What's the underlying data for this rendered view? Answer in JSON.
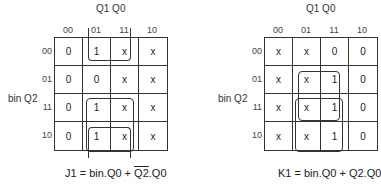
{
  "kmaps": [
    {
      "id": "J1",
      "col_title": "Q1 Q0",
      "row_title": "bin Q2",
      "col_labels": [
        "00",
        "01",
        "11",
        "10"
      ],
      "row_labels": [
        "00",
        "01",
        "11",
        "10"
      ],
      "cells": [
        [
          "0",
          "1",
          "x",
          "x"
        ],
        [
          "0",
          "0",
          "x",
          "x"
        ],
        [
          "0",
          "1",
          "x",
          "x"
        ],
        [
          "0",
          "1",
          "x",
          "x"
        ]
      ],
      "equation": {
        "prefix": "J1 = bin.Q0 + ",
        "complemented": "Q2",
        "suffix": ".Q0"
      }
    },
    {
      "id": "K1",
      "col_title": "Q1 Q0",
      "row_title": "bin Q2",
      "col_labels": [
        "00",
        "01",
        "11",
        "10"
      ],
      "row_labels": [
        "00",
        "01",
        "11",
        "10"
      ],
      "cells": [
        [
          "x",
          "x",
          "0",
          "0"
        ],
        [
          "x",
          "x",
          "1",
          "0"
        ],
        [
          "x",
          "x",
          "1",
          "0"
        ],
        [
          "x",
          "x",
          "1",
          "0"
        ]
      ],
      "equation": {
        "text": "K1 = bin.Q0 + Q2.Q0"
      }
    }
  ]
}
